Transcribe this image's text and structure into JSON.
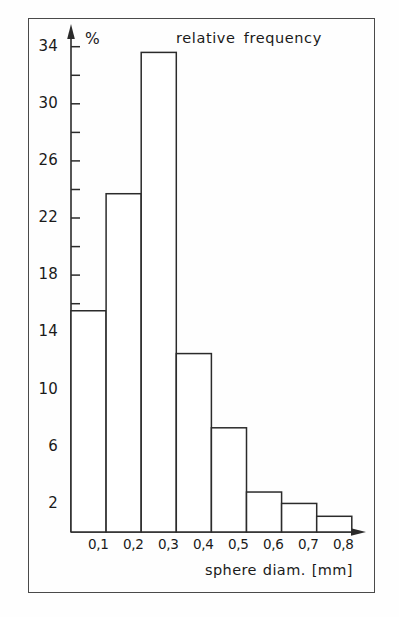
{
  "chart_data": {
    "type": "bar",
    "title": "relative frequency",
    "xlabel": "sphere diam. [mm]",
    "ylabel": "%",
    "yunit": "%",
    "categories": [
      "0,1",
      "0,2",
      "0,3",
      "0,4",
      "0,5",
      "0,6",
      "0,7",
      "0,8"
    ],
    "bin_edges": [
      0.0,
      0.1,
      0.2,
      0.3,
      0.4,
      0.5,
      0.6,
      0.7,
      0.8
    ],
    "values": [
      15.5,
      23.7,
      33.6,
      12.5,
      7.3,
      2.8,
      2.0,
      1.1
    ],
    "ylim": [
      0,
      34
    ],
    "xlim": [
      0.0,
      0.8
    ],
    "ytick_labels": [
      "2",
      "6",
      "10",
      "14",
      "18",
      "22",
      "26",
      "30",
      "34"
    ],
    "ytick_values": [
      2,
      6,
      10,
      14,
      18,
      22,
      26,
      30,
      34
    ],
    "yminor_tick_values": [
      2,
      4,
      6,
      8,
      10,
      12,
      14,
      16,
      18,
      20,
      22,
      24,
      26,
      28,
      30,
      32,
      34
    ],
    "xtick_labels": [
      "0,1",
      "0,2",
      "0,3",
      "0,4",
      "0,5",
      "0,6",
      "0,7",
      "0,8"
    ],
    "xtick_values": [
      0.1,
      0.2,
      0.3,
      0.4,
      0.5,
      0.6,
      0.7,
      0.8
    ],
    "grid": false,
    "legend": null,
    "bar_fill": "#ffffff",
    "bar_stroke": "#2b2b2b",
    "axis_color": "#2b2b2b",
    "frame_color": "#4a4a4a",
    "background": "#fefefe",
    "y_axis_arrow": true,
    "x_axis_arrow": true
  }
}
